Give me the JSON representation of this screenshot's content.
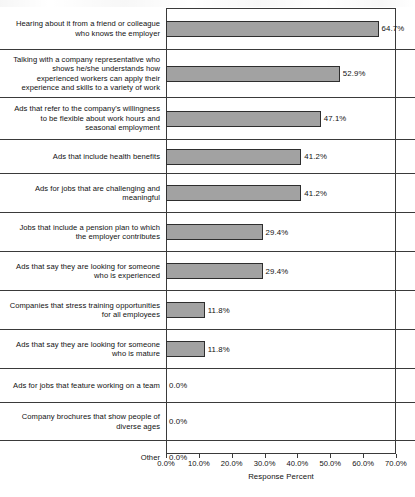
{
  "chart_data": {
    "type": "bar",
    "orientation": "horizontal",
    "title": "",
    "xlabel": "Response Percent",
    "ylabel": "",
    "xlim": [
      0.0,
      70.0
    ],
    "grid": false,
    "legend": null,
    "value_label_format": "0.0%",
    "xticklabels": [
      "0.0%",
      "10.0%",
      "20.0%",
      "30.0%",
      "40.0%",
      "50.0%",
      "60.0%",
      "70.0%"
    ],
    "xtickvalues": [
      0.0,
      10.0,
      20.0,
      30.0,
      40.0,
      50.0,
      60.0,
      70.0
    ],
    "categories": [
      "Hearing about it from a friend or colleague who knows the employer",
      "Talking with a company representative who shows he/she understands how experienced workers can apply their experience and skills to a variety of work",
      "Ads that refer to the company's willingness to be flexible about work hours and seasonal employment",
      "Ads that include health benefits",
      "Ads for jobs that are challenging and meaningful",
      "Jobs that include a pension plan to which the employer contributes",
      "Ads that say they are looking for someone who is experienced",
      "Companies that stress training opportunities for all employees",
      "Ads that say they are looking for someone who is mature",
      "Ads for jobs that feature working on a team",
      "Company brochures that show people of diverse ages",
      "Other"
    ],
    "values": [
      64.7,
      52.9,
      47.1,
      41.2,
      41.2,
      29.4,
      29.4,
      11.8,
      11.8,
      0.0,
      0.0,
      0.0
    ],
    "value_labels": [
      "64.7%",
      "52.9%",
      "47.1%",
      "41.2%",
      "41.2%",
      "29.4%",
      "29.4%",
      "11.8%",
      "11.8%",
      "0.0%",
      "0.0%",
      "0.0%"
    ],
    "bars": [
      {
        "label_lines": [
          "Hearing about it from a friend or colleague",
          "who knows the employer"
        ],
        "value": 64.7,
        "value_label": "64.7%",
        "row_height": 42
      },
      {
        "label_lines": [
          "Talking with a company representative who",
          "shows he/she understands how",
          "experienced workers can apply their",
          "experience and skills to a variety of work"
        ],
        "value": 52.9,
        "value_label": "52.9%",
        "row_height": 48
      },
      {
        "label_lines": [
          "Ads that refer to the company's willingness",
          "to be flexible about work hours and",
          "seasonal employment"
        ],
        "value": 47.1,
        "value_label": "47.1%",
        "row_height": 42
      },
      {
        "label_lines": [
          "Ads that include health benefits"
        ],
        "value": 41.2,
        "value_label": "41.2%",
        "row_height": 34
      },
      {
        "label_lines": [
          "Ads for jobs that are challenging and",
          "meaningful"
        ],
        "value": 41.2,
        "value_label": "41.2%",
        "row_height": 39
      },
      {
        "label_lines": [
          "Jobs that include a pension plan to which",
          "the employer contributes"
        ],
        "value": 29.4,
        "value_label": "29.4%",
        "row_height": 39
      },
      {
        "label_lines": [
          "Ads that say they are looking for someone",
          "who is experienced"
        ],
        "value": 29.4,
        "value_label": "29.4%",
        "row_height": 39
      },
      {
        "label_lines": [
          "Companies that stress training opportunities",
          "for all employees"
        ],
        "value": 11.8,
        "value_label": "11.8%",
        "row_height": 39
      },
      {
        "label_lines": [
          "Ads that say they are looking for someone",
          "who is mature"
        ],
        "value": 11.8,
        "value_label": "11.8%",
        "row_height": 39
      },
      {
        "label_lines": [
          "Ads for jobs that feature working on a team"
        ],
        "value": 0.0,
        "value_label": "0.0%",
        "row_height": 34
      },
      {
        "label_lines": [
          "Company brochures that show people of",
          "diverse ages"
        ],
        "value": 0.0,
        "value_label": "0.0%",
        "row_height": 38
      },
      {
        "label_lines": [
          "Other"
        ],
        "value": 0.0,
        "value_label": "0.0%",
        "row_height": 33
      }
    ]
  },
  "colors": {
    "bar_fill": "#a2a2a2",
    "bar_stroke": "#2e2e2e",
    "axis": "#3a3a3a",
    "text": "#111111",
    "background": "#ffffff"
  }
}
